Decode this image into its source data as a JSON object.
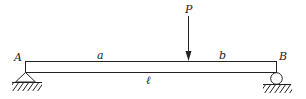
{
  "diagram": {
    "type": "simply-supported-beam",
    "labels": {
      "left_support": "A",
      "right_support": "B",
      "load": "P",
      "left_segment": "a",
      "right_segment": "b",
      "span": "ℓ"
    },
    "supports": {
      "left": "pin",
      "right": "roller"
    },
    "colors": {
      "line": "#222222",
      "background": "#ffffff"
    }
  }
}
